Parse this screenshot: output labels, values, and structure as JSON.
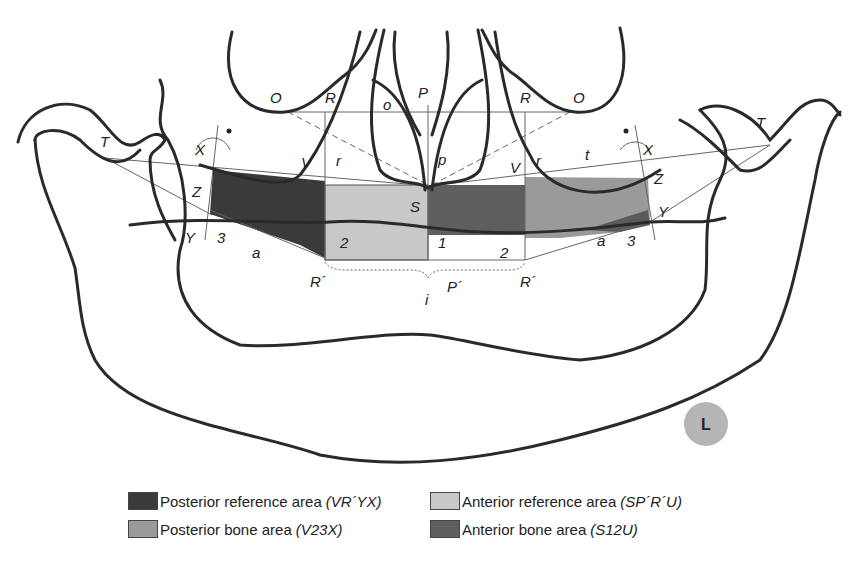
{
  "figure": {
    "landmarks": {
      "O_left": "O",
      "O_right": "O",
      "R_left": "R",
      "R_right": "R",
      "o": "o",
      "P": "P",
      "p": "p",
      "T_left": "T",
      "T_right": "T",
      "X_left": "X",
      "X_right": "X",
      "V_left": "V",
      "V_right": "V",
      "r_left": "r",
      "r_right": "r",
      "t": "t",
      "Z_left": "Z",
      "Z_right": "Z",
      "Y_left": "Y",
      "Y_right": "Y",
      "three_left": "3",
      "three_right": "3",
      "a_left": "a",
      "a_right": "a",
      "S": "S",
      "two_left": "2",
      "two_right": "2",
      "one": "1",
      "R_prime_left": "R´",
      "R_prime_right": "R´",
      "P_prime": "P´",
      "i": "i"
    },
    "side_badge": "L",
    "colors": {
      "posterior_reference": "#3a3a3a",
      "anterior_reference": "#c8c8c8",
      "posterior_bone": "#9a9a9a",
      "anterior_bone": "#5e5e5e",
      "badge": "#b5b5b5"
    }
  },
  "legend": {
    "items": [
      {
        "label": "Posterior reference area",
        "code": "(VR´YX)",
        "color": "#3a3a3a"
      },
      {
        "label": "Anterior reference area",
        "code": "(SP´R´U)",
        "color": "#c8c8c8"
      },
      {
        "label": "Posterior bone area",
        "code": "(V23X)",
        "color": "#9a9a9a"
      },
      {
        "label": "Anterior bone area",
        "code": "(S12U)",
        "color": "#5e5e5e"
      }
    ]
  }
}
